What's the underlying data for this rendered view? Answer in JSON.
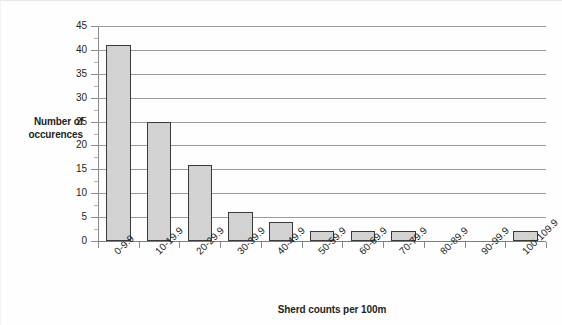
{
  "chart_data": {
    "type": "bar",
    "title": "",
    "subtitle": "",
    "xlabel": "Sherd counts per 100m",
    "ylabel": "Number of occurences",
    "categories": [
      "0-9.9",
      "10-19.9",
      "20-29.9",
      "30-39.9",
      "40-49.9",
      "50-59.9",
      "60-69.9",
      "70-79.9",
      "80-89.9",
      "90-99.9",
      "100-109.9"
    ],
    "values": [
      41,
      25,
      16,
      6,
      4,
      2,
      2,
      2,
      0,
      0,
      2
    ],
    "ylim": [
      0,
      45
    ],
    "ytick_labels": [
      "0",
      "5",
      "10",
      "15",
      "20",
      "25",
      "30",
      "35",
      "40",
      "45"
    ],
    "ytick_values": [
      0,
      5,
      10,
      15,
      20,
      25,
      30,
      35,
      40,
      45
    ],
    "grid": "horizontal",
    "legend": "none",
    "bar_fill": "#d2d2d2",
    "bar_border": "#3a3a3a",
    "gridline_color": "#9a9a9a",
    "axis_color": "#8a8a8a",
    "text_color": "#231f20",
    "background": "#ffffff",
    "xlabel_rotation": -45
  }
}
